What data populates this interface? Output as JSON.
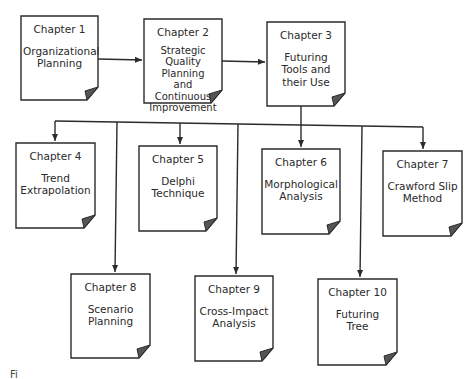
{
  "diagram": {
    "type": "flowchart",
    "colors": {
      "stroke": "#2b2b2b",
      "fold": "#555555",
      "background": "#ffffff"
    },
    "nodes": [
      {
        "id": "ch1",
        "chapter": "Chapter 1",
        "title": "Organizational\nPlanning"
      },
      {
        "id": "ch2",
        "chapter": "Chapter 2",
        "title": "Strategic Quality\nPlanning\nand Continuous\nImprovement"
      },
      {
        "id": "ch3",
        "chapter": "Chapter 3",
        "title": "Futuring\nTools and\ntheir Use"
      },
      {
        "id": "ch4",
        "chapter": "Chapter 4",
        "title": "Trend\nExtrapolation"
      },
      {
        "id": "ch5",
        "chapter": "Chapter 5",
        "title": "Delphi\nTechnique"
      },
      {
        "id": "ch6",
        "chapter": "Chapter 6",
        "title": "Morphological\nAnalysis"
      },
      {
        "id": "ch7",
        "chapter": "Chapter 7",
        "title": "Crawford Slip\nMethod"
      },
      {
        "id": "ch8",
        "chapter": "Chapter 8",
        "title": "Scenario\nPlanning"
      },
      {
        "id": "ch9",
        "chapter": "Chapter 9",
        "title": "Cross-Impact\nAnalysis"
      },
      {
        "id": "ch10",
        "chapter": "Chapter 10",
        "title": "Futuring\nTree"
      }
    ],
    "edges": [
      {
        "from": "ch1",
        "to": "ch2"
      },
      {
        "from": "ch2",
        "to": "ch3"
      },
      {
        "from": "ch3",
        "to": "ch4"
      },
      {
        "from": "ch3",
        "to": "ch5"
      },
      {
        "from": "ch3",
        "to": "ch6"
      },
      {
        "from": "ch3",
        "to": "ch7"
      },
      {
        "from": "ch3",
        "to": "ch8"
      },
      {
        "from": "ch3",
        "to": "ch9"
      },
      {
        "from": "ch3",
        "to": "ch10"
      }
    ]
  },
  "caption": "Fi"
}
